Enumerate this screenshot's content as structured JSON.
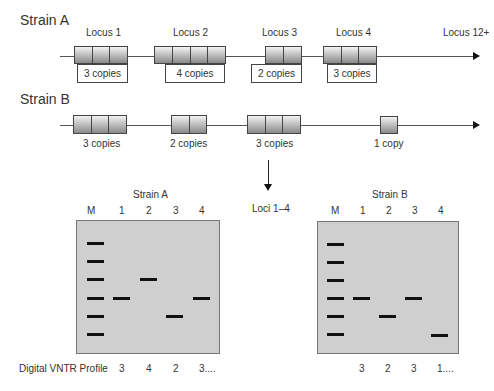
{
  "strain_a": {
    "title": "Strain A",
    "end_label": "Locus 12+",
    "loci": [
      {
        "name": "Locus 1",
        "copies": 3,
        "copy_label": "3 copies"
      },
      {
        "name": "Locus 2",
        "copies": 4,
        "copy_label": "4 copies"
      },
      {
        "name": "Locus 3",
        "copies": 2,
        "copy_label": "2 copies"
      },
      {
        "name": "Locus 4",
        "copies": 3,
        "copy_label": "3 copies"
      }
    ]
  },
  "strain_b": {
    "title": "Strain B",
    "loci": [
      {
        "copies": 3,
        "copy_label": "3 copies"
      },
      {
        "copies": 2,
        "copy_label": "2 copies"
      },
      {
        "copies": 3,
        "copy_label": "3 copies"
      },
      {
        "copies": 1,
        "copy_label": "1 copy"
      }
    ]
  },
  "arrow_label": "Loci 1–4",
  "gels": {
    "a": {
      "title": "Strain A",
      "lanes": [
        "M",
        "1",
        "2",
        "3",
        "4"
      ],
      "profile": [
        "3",
        "4",
        "2",
        "3...."
      ]
    },
    "b": {
      "title": "Strain B",
      "lanes": [
        "M",
        "1",
        "2",
        "3",
        "4"
      ],
      "profile": [
        "3",
        "2",
        "3",
        "1...."
      ]
    }
  },
  "profile_label": "Digital VNTR Profile"
}
